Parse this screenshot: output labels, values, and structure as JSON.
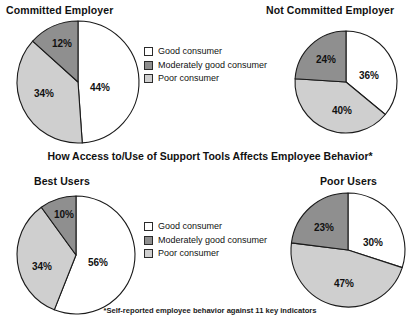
{
  "section_heading": "How Access to/Use of Support Tools Affects Employee Behavior*",
  "footnote": "*Self-reported employee behavior against 11 key indicators",
  "colors": {
    "good": "#ffffff",
    "moderate": "#8f8f8f",
    "poor": "#cfcfcf",
    "outline": "#1a1a1a",
    "text": "#111111"
  },
  "legend": {
    "items": [
      {
        "label": "Good consumer",
        "color": "#ffffff",
        "key": "good"
      },
      {
        "label": "Moderately good consumer",
        "color": "#8f8f8f",
        "key": "moderate"
      },
      {
        "label": "Poor consumer",
        "color": "#cfcfcf",
        "key": "poor"
      }
    ]
  },
  "chart_data": [
    {
      "type": "pie",
      "title": "Committed Employer",
      "position": "top-left",
      "categories": [
        "Good consumer",
        "Moderately good consumer",
        "Poor consumer"
      ],
      "values": [
        44,
        34,
        12
      ],
      "labels": [
        "44%",
        "34%",
        "12%"
      ],
      "colors": [
        "#ffffff",
        "#8f8f8f",
        "#cfcfcf"
      ],
      "slice_order_clockwise_from_top": [
        "Good consumer",
        "Poor consumer",
        "Moderately good consumer"
      ],
      "slice_order_values": [
        44,
        34,
        12
      ],
      "units": "percent"
    },
    {
      "type": "pie",
      "title": "Not Committed Employer",
      "position": "top-right",
      "categories": [
        "Good consumer",
        "Moderately good consumer",
        "Poor consumer"
      ],
      "values": [
        36,
        24,
        40
      ],
      "labels": [
        "36%",
        "24%",
        "40%"
      ],
      "colors": [
        "#ffffff",
        "#8f8f8f",
        "#cfcfcf"
      ],
      "slice_order_clockwise_from_top": [
        "Good consumer",
        "Poor consumer",
        "Moderately good consumer"
      ],
      "slice_order_values": [
        36,
        40,
        24
      ],
      "units": "percent"
    },
    {
      "type": "pie",
      "title": "Best Users",
      "position": "bottom-left",
      "categories": [
        "Good consumer",
        "Moderately good consumer",
        "Poor consumer"
      ],
      "values": [
        56,
        34,
        10
      ],
      "labels": [
        "56%",
        "34%",
        "10%"
      ],
      "colors": [
        "#ffffff",
        "#8f8f8f",
        "#cfcfcf"
      ],
      "slice_order_clockwise_from_top": [
        "Good consumer",
        "Poor consumer",
        "Moderately good consumer"
      ],
      "slice_order_values": [
        56,
        34,
        10
      ],
      "units": "percent"
    },
    {
      "type": "pie",
      "title": "Poor Users",
      "position": "bottom-right",
      "categories": [
        "Good consumer",
        "Moderately good consumer",
        "Poor consumer"
      ],
      "values": [
        30,
        23,
        47
      ],
      "labels": [
        "30%",
        "23%",
        "47%"
      ],
      "colors": [
        "#ffffff",
        "#8f8f8f",
        "#cfcfcf"
      ],
      "slice_order_clockwise_from_top": [
        "Good consumer",
        "Poor consumer",
        "Moderately good consumer"
      ],
      "slice_order_values": [
        30,
        47,
        23
      ],
      "units": "percent"
    }
  ]
}
